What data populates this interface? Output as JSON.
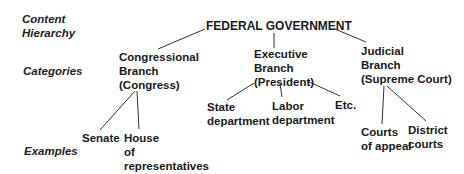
{
  "levels": {
    "content_hierarchy": [
      "Content",
      "Hierarchy"
    ],
    "categories": "Categories",
    "examples": "Examples"
  },
  "root": "FEDERAL GOVERNMENT",
  "branches": [
    {
      "lines": [
        "Congressional",
        "Branch",
        "(Congress)"
      ],
      "examples": [
        {
          "lines": [
            "Senate"
          ]
        },
        {
          "lines": [
            "House",
            "of",
            "representatives"
          ]
        }
      ]
    },
    {
      "lines": [
        "Executive",
        "Branch",
        "(President)"
      ],
      "examples": [
        {
          "lines": [
            "State",
            "department"
          ]
        },
        {
          "lines": [
            "Labor",
            "department"
          ]
        },
        {
          "lines": [
            "Etc."
          ]
        }
      ]
    },
    {
      "lines": [
        "Judicial",
        "Branch",
        "(Supreme Court)"
      ],
      "examples": [
        {
          "lines": [
            "Courts",
            "of appeal"
          ]
        },
        {
          "lines": [
            "District",
            "courts"
          ]
        }
      ]
    }
  ]
}
